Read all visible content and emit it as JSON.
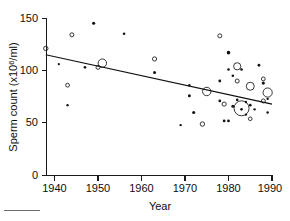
{
  "chart_data": {
    "type": "scatter",
    "title": "",
    "xlabel": "Year",
    "ylabel": "Sperm count (x10^6/ml)",
    "ylabel_prefix": "Sperm count (x10",
    "ylabel_exponent": "6",
    "ylabel_suffix": "/ml)",
    "xlim": [
      1936,
      1991
    ],
    "ylim": [
      0,
      150
    ],
    "xticks": [
      1940,
      1950,
      1960,
      1970,
      1980,
      1990
    ],
    "xtick_labels": [
      "1940",
      "1950",
      "1960",
      "1970",
      "1980",
      "1990"
    ],
    "yticks": [
      0,
      50,
      100,
      150
    ],
    "ytick_labels": [
      "0",
      "50",
      "100",
      "150"
    ],
    "grid": false,
    "legend": "none",
    "marker_style": "open circles and filled dots, size proportional to study sample size",
    "trendline": {
      "type": "linear-regression",
      "x_start": 1938,
      "y_start": 115,
      "x_end": 1990,
      "y_end": 68
    },
    "points": [
      {
        "x": 1938,
        "y": 121,
        "r": 2.2,
        "filled": false
      },
      {
        "x": 1941,
        "y": 106,
        "r": 1.1,
        "filled": true
      },
      {
        "x": 1943,
        "y": 86,
        "r": 1.9,
        "filled": false
      },
      {
        "x": 1943,
        "y": 67,
        "r": 1.2,
        "filled": true
      },
      {
        "x": 1944,
        "y": 134,
        "r": 2.0,
        "filled": false
      },
      {
        "x": 1947,
        "y": 103,
        "r": 1.3,
        "filled": true
      },
      {
        "x": 1949,
        "y": 145,
        "r": 1.6,
        "filled": true
      },
      {
        "x": 1950,
        "y": 103,
        "r": 2.0,
        "filled": false
      },
      {
        "x": 1951,
        "y": 107,
        "r": 4.2,
        "filled": false
      },
      {
        "x": 1956,
        "y": 135,
        "r": 1.3,
        "filled": true
      },
      {
        "x": 1963,
        "y": 111,
        "r": 2.1,
        "filled": false
      },
      {
        "x": 1963,
        "y": 98,
        "r": 1.5,
        "filled": true
      },
      {
        "x": 1969,
        "y": 48,
        "r": 1.2,
        "filled": true
      },
      {
        "x": 1971,
        "y": 86,
        "r": 1.2,
        "filled": true
      },
      {
        "x": 1971,
        "y": 76,
        "r": 1.5,
        "filled": true
      },
      {
        "x": 1972,
        "y": 60,
        "r": 1.6,
        "filled": true
      },
      {
        "x": 1974,
        "y": 49,
        "r": 2.2,
        "filled": false
      },
      {
        "x": 1975,
        "y": 80,
        "r": 4.2,
        "filled": false
      },
      {
        "x": 1978,
        "y": 133,
        "r": 2.0,
        "filled": false
      },
      {
        "x": 1978,
        "y": 90,
        "r": 1.4,
        "filled": true
      },
      {
        "x": 1978,
        "y": 71,
        "r": 1.4,
        "filled": true
      },
      {
        "x": 1979,
        "y": 68,
        "r": 2.1,
        "filled": false
      },
      {
        "x": 1979,
        "y": 52,
        "r": 1.4,
        "filled": true
      },
      {
        "x": 1980,
        "y": 117,
        "r": 1.8,
        "filled": true
      },
      {
        "x": 1980,
        "y": 101,
        "r": 1.3,
        "filled": true
      },
      {
        "x": 1980,
        "y": 52,
        "r": 1.4,
        "filled": true
      },
      {
        "x": 1981,
        "y": 95,
        "r": 1.3,
        "filled": true
      },
      {
        "x": 1981,
        "y": 66,
        "r": 1.5,
        "filled": true
      },
      {
        "x": 1982,
        "y": 104,
        "r": 3.6,
        "filled": false
      },
      {
        "x": 1982,
        "y": 90,
        "r": 2.0,
        "filled": false
      },
      {
        "x": 1982,
        "y": 72,
        "r": 1.3,
        "filled": true
      },
      {
        "x": 1983,
        "y": 101,
        "r": 1.3,
        "filled": true
      },
      {
        "x": 1983,
        "y": 64,
        "r": 7.5,
        "filled": false
      },
      {
        "x": 1983,
        "y": 63,
        "r": 1.3,
        "filled": true
      },
      {
        "x": 1984,
        "y": 70,
        "r": 1.2,
        "filled": true
      },
      {
        "x": 1984,
        "y": 58,
        "r": 1.2,
        "filled": true
      },
      {
        "x": 1985,
        "y": 85,
        "r": 4.0,
        "filled": false
      },
      {
        "x": 1985,
        "y": 67,
        "r": 1.3,
        "filled": true
      },
      {
        "x": 1985,
        "y": 54,
        "r": 1.8,
        "filled": false
      },
      {
        "x": 1986,
        "y": 63,
        "r": 1.2,
        "filled": true
      },
      {
        "x": 1987,
        "y": 105,
        "r": 1.4,
        "filled": true
      },
      {
        "x": 1988,
        "y": 92,
        "r": 1.9,
        "filled": false
      },
      {
        "x": 1988,
        "y": 88,
        "r": 1.6,
        "filled": true
      },
      {
        "x": 1988,
        "y": 71,
        "r": 2.0,
        "filled": false
      },
      {
        "x": 1989,
        "y": 79,
        "r": 4.6,
        "filled": false
      },
      {
        "x": 1989,
        "y": 60,
        "r": 1.2,
        "filled": true
      },
      {
        "x": 1989,
        "y": 73,
        "r": 1.2,
        "filled": true
      }
    ]
  },
  "axes": {
    "y_tick_0": "0",
    "y_tick_50": "50",
    "y_tick_100": "100",
    "y_tick_150": "150",
    "x_tick_1940": "1940",
    "x_tick_1950": "1950",
    "x_tick_1960": "1960",
    "x_tick_1970": "1970",
    "x_tick_1980": "1980",
    "x_tick_1990": "1990",
    "x_title": "Year",
    "y_title_prefix": "Sperm count (x10",
    "y_title_exponent": "6",
    "y_title_suffix": "/ml)"
  }
}
